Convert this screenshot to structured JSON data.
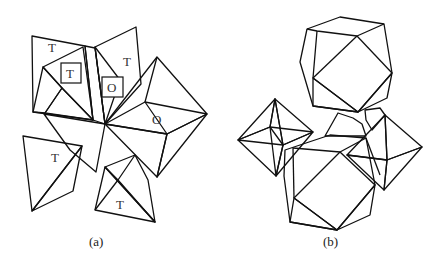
{
  "figure": {
    "panels": [
      {
        "id": "a",
        "caption": "(a)",
        "labels": [
          {
            "text": "T",
            "x": 48,
            "y": 52,
            "boxed": false
          },
          {
            "text": "T",
            "x": 66,
            "y": 78,
            "boxed": true
          },
          {
            "text": "T",
            "x": 123,
            "y": 66,
            "boxed": false
          },
          {
            "text": "O",
            "x": 107,
            "y": 92,
            "boxed": true
          },
          {
            "text": "O",
            "x": 152,
            "y": 124,
            "boxed": false
          },
          {
            "text": "T",
            "x": 51,
            "y": 162,
            "boxed": false
          },
          {
            "text": "T",
            "x": 116,
            "y": 209,
            "boxed": false
          }
        ]
      },
      {
        "id": "b",
        "caption": "(b)"
      }
    ],
    "colors": {
      "dark": "#3c3c3c",
      "mid": "#6e6e6e",
      "medium": "#8c8c8c",
      "light": "#b8b8b8",
      "pale": "#d9d9d9",
      "black": "#1a1a1a",
      "face": "#ffffff"
    }
  }
}
